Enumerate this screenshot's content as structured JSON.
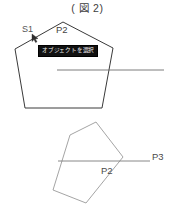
{
  "figure": {
    "title": "( 図 2)",
    "width": 175,
    "height": 217
  },
  "top_shape": {
    "name": "pentagon-top",
    "stroke_color": "#3a3a3a",
    "labels": {
      "s1": "S1",
      "p2": "P2"
    },
    "tooltip": {
      "text": "オブジェクトを選択",
      "background_color": "#111111",
      "text_color": "#f2f2f2"
    },
    "cursor_marker": "arrow-cursor"
  },
  "bottom_shape": {
    "name": "pentagon-bottom",
    "stroke_color": "#9a9a9a",
    "labels": {
      "p2": "P2",
      "p3": "P3"
    }
  },
  "guide_lines": {
    "top_line_color": "#6e6e6e",
    "bottom_line_color": "#7a7a7a"
  },
  "colors": {
    "background": "#ffffff",
    "dark_stroke": "#3a3a3a",
    "light_stroke": "#9a9a9a",
    "text": "#4a4a4a"
  }
}
